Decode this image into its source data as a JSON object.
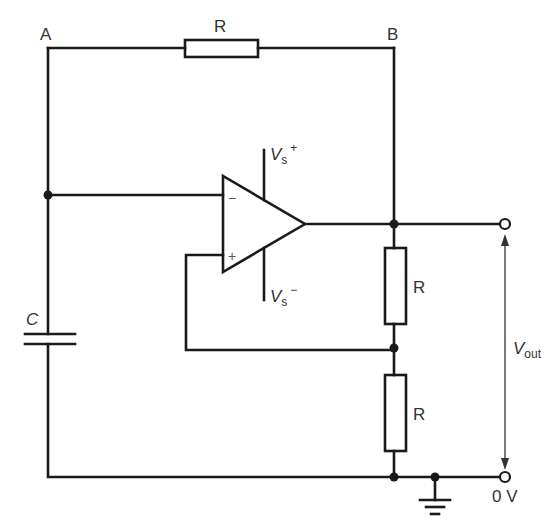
{
  "diagram": {
    "nodes": {
      "a": {
        "label": "A"
      },
      "b": {
        "label": "B"
      }
    },
    "components": {
      "feedback_resistor": {
        "label": "R"
      },
      "capacitor": {
        "label": "C"
      },
      "divider_resistor_top": {
        "label": "R"
      },
      "divider_resistor_bottom": {
        "label": "R"
      },
      "opamp": {
        "inverting_sign": "−",
        "noninverting_sign": "+",
        "supply_pos": {
          "main": "V",
          "sub": "s",
          "sup": "+"
        },
        "supply_neg": {
          "main": "V",
          "sub": "s",
          "sup": "−"
        }
      }
    },
    "output": {
      "vout": {
        "main": "V",
        "sub": "out"
      },
      "ground_label": "0 V"
    },
    "colors": {
      "wire": "#1a1a1a",
      "text": "#333333",
      "background": "#ffffff"
    }
  }
}
